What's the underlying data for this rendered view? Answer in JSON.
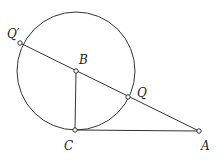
{
  "diagram": {
    "circle": {
      "center": "B",
      "cx": 76,
      "cy": 71,
      "r": 59
    },
    "points": [
      {
        "id": "Qp",
        "label": "Q′",
        "x": 20,
        "y": 43,
        "lx": 7,
        "ly": 38
      },
      {
        "id": "B",
        "label": "B",
        "x": 76,
        "y": 71,
        "lx": 76,
        "ly": 64
      },
      {
        "id": "Q",
        "label": "Q",
        "x": 128,
        "y": 97,
        "lx": 137,
        "ly": 96
      },
      {
        "id": "C",
        "label": "C",
        "x": 75,
        "y": 130,
        "lx": 64,
        "ly": 150
      },
      {
        "id": "A",
        "label": "A",
        "x": 199,
        "y": 131,
        "lx": 201,
        "ly": 150
      }
    ],
    "segments": [
      {
        "from": "Qp",
        "to": "A",
        "name": "secant-line"
      },
      {
        "from": "B",
        "to": "C",
        "name": "radius-BC"
      },
      {
        "from": "C",
        "to": "A",
        "name": "tangent-CA"
      }
    ],
    "colors": {
      "stroke": "#333333",
      "background": "#ffffff"
    }
  }
}
